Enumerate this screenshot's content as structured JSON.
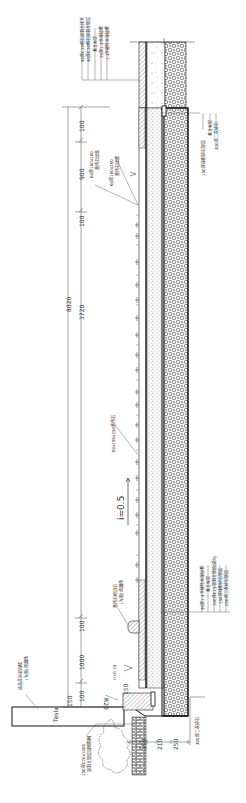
{
  "drawing": {
    "title": "Ramp pavement cross-section (CAD detail)",
    "orientation": "rotated 90°",
    "colors": {
      "line": "#222222",
      "hatch": "#555555",
      "background": "#ffffff"
    },
    "dimensions": {
      "overall": "8020",
      "middle": "3720",
      "top_seg_1": "100",
      "top_seg_2": "900",
      "top_seg_3": "100",
      "bottom_seg_1": "100",
      "bottom_seg_2": "1000",
      "bottom_seg_3": "150",
      "bottom_seg_4": "100",
      "foot_dim_1": "250",
      "foot_dim_2": "210",
      "foot_dim_3": "150",
      "step_dim": "150",
      "radius": "R20"
    },
    "slope_label": "i=0.5",
    "elevation_label": "H+0.15",
    "callouts": {
      "paver": "60x190x250黄锈石",
      "top_edge_1": "60厚100x100",
      "top_edge_1_sub": "黄锈石烧面",
      "top_edge_2": "60厚100x200",
      "top_edge_2_sub": "黄锈石烧面",
      "curb_note": "黄锈石收边石",
      "curb_note_sub": "(光面) 倒圆角",
      "wall_block": "Tesla",
      "wall_note_1": "成品花岗岩挡墙",
      "wall_note_2": "(光面) 倒圆角",
      "base_note_1": "150厚C20x1000",
      "base_note_2": "混凝土垫层加钢筋网",
      "foot_note": "300厚二灰碎石"
    },
    "layer_notes_top": [
      "50厚C20细石混凝土找平",
      "50厚C20细石混凝土垫层",
      "素土夯实",
      "20厚1:3水泥砂浆",
      "1:3干硬性水泥砂浆"
    ],
    "layer_notes_right_top": [
      "150厚级配碎石垫层",
      "素土夯实",
      "300厚二灰碎石"
    ],
    "layer_notes_right_bottom": [
      "30厚1:3干硬性水泥砂浆",
      "素土夯实",
      "100厚C15混凝土垫层(双向)",
      "150厚级配碎石垫层",
      "200厚二灰碎石垫层"
    ],
    "paver_marks_count": 26
  }
}
